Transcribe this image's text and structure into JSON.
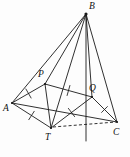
{
  "figure": {
    "type": "geometry-diagram",
    "canvas": {
      "width": 130,
      "height": 157
    },
    "stroke_color": "#1a1a1a",
    "background_color": "#fdfdfd",
    "vertices": [
      {
        "id": "B",
        "label": "B",
        "x": 86,
        "y": 14,
        "label_x": 89,
        "label_y": 2,
        "dot": true
      },
      {
        "id": "P",
        "label": "P",
        "x": 45,
        "y": 84,
        "label_x": 38,
        "label_y": 70,
        "dot": true
      },
      {
        "id": "Q",
        "label": "Q",
        "x": 92,
        "y": 97,
        "label_x": 89,
        "label_y": 84,
        "dot": true
      },
      {
        "id": "A",
        "label": "A",
        "x": 12,
        "y": 103,
        "label_x": 3,
        "label_y": 104,
        "dot": true
      },
      {
        "id": "T",
        "label": "T",
        "x": 51,
        "y": 128,
        "label_x": 45,
        "label_y": 133,
        "dot": true
      },
      {
        "id": "C",
        "label": "C",
        "x": 117,
        "y": 122,
        "label_x": 113,
        "label_y": 128,
        "dot": true
      }
    ],
    "edges": [
      {
        "name": "edge-A-B",
        "from": "A",
        "to": "B",
        "style": "solid"
      },
      {
        "name": "edge-B-P",
        "from": "B",
        "to": "P",
        "style": "solid"
      },
      {
        "name": "edge-B-T",
        "from": "B",
        "to": "T",
        "style": "solid"
      },
      {
        "name": "edge-B-Q",
        "from": "B",
        "to": "Q",
        "style": "solid"
      },
      {
        "name": "edge-B-C",
        "from": "B",
        "to": "C",
        "style": "solid"
      },
      {
        "name": "edge-B-foot",
        "from": "B",
        "to": "foot",
        "style": "solid"
      },
      {
        "name": "edge-A-P",
        "from": "A",
        "to": "P",
        "style": "solid"
      },
      {
        "name": "edge-A-T",
        "from": "A",
        "to": "T",
        "style": "solid"
      },
      {
        "name": "edge-A-C",
        "from": "A",
        "to": "C",
        "style": "solid"
      },
      {
        "name": "edge-P-Q",
        "from": "P",
        "to": "Q",
        "style": "solid"
      },
      {
        "name": "edge-P-T",
        "from": "P",
        "to": "T",
        "style": "solid"
      },
      {
        "name": "edge-T-Q",
        "from": "T",
        "to": "Q",
        "style": "solid"
      },
      {
        "name": "edge-Q-C",
        "from": "Q",
        "to": "C",
        "style": "solid"
      },
      {
        "name": "edge-T-C",
        "from": "T",
        "to": "C",
        "style": "dashed"
      }
    ],
    "tick_marks": [
      {
        "name": "tick-on-AP",
        "segment": "A-P",
        "count": 1
      },
      {
        "name": "tick-on-PQ",
        "segment": "P-Q",
        "count": 1
      },
      {
        "name": "tick-on-AT",
        "segment": "A-T",
        "count": 1
      },
      {
        "name": "tick-on-TQ",
        "segment": "T-Q",
        "count": 1
      },
      {
        "name": "tick-on-QC",
        "segment": "Q-C",
        "count": 1
      }
    ],
    "foot": {
      "x": 86,
      "y": 141
    }
  }
}
